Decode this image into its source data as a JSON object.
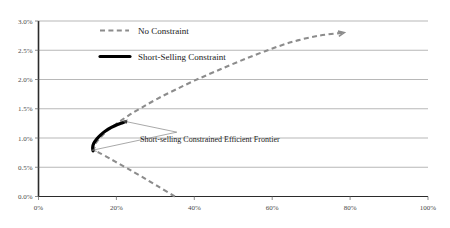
{
  "chart_data": {
    "type": "line",
    "title": "",
    "subtitle": "",
    "xlabel": "",
    "ylabel": "",
    "xlim": [
      0,
      100
    ],
    "ylim": [
      0,
      3.0
    ],
    "x_tick_labels": [
      "0%",
      "20%",
      "40%",
      "60%",
      "80%",
      "100%"
    ],
    "x_ticks": [
      0,
      20,
      40,
      60,
      80,
      100
    ],
    "y_tick_labels": [
      "0.0%",
      "0.5%",
      "1.0%",
      "1.5%",
      "2.0%",
      "2.5%",
      "3.0%"
    ],
    "y_ticks": [
      0.0,
      0.5,
      1.0,
      1.5,
      2.0,
      2.5,
      3.0
    ],
    "grid": "horizontal",
    "legend_position": "top-center",
    "series": [
      {
        "name": "No Constraint",
        "style": "dashed",
        "color": "#8c8c8c",
        "points": [
          [
            35.0,
            0.0
          ],
          [
            30.5,
            0.18
          ],
          [
            26.5,
            0.34
          ],
          [
            22.8,
            0.48
          ],
          [
            19.6,
            0.6
          ],
          [
            17.2,
            0.69
          ],
          [
            15.5,
            0.75
          ],
          [
            14.4,
            0.78
          ],
          [
            14.1,
            0.81
          ],
          [
            14.6,
            0.9
          ],
          [
            15.8,
            1.0
          ],
          [
            17.6,
            1.12
          ],
          [
            20.0,
            1.24
          ],
          [
            23.0,
            1.38
          ],
          [
            26.5,
            1.52
          ],
          [
            30.5,
            1.67
          ],
          [
            35.0,
            1.82
          ],
          [
            40.0,
            1.98
          ],
          [
            45.5,
            2.14
          ],
          [
            51.5,
            2.31
          ],
          [
            58.0,
            2.48
          ],
          [
            65.0,
            2.64
          ],
          [
            72.0,
            2.75
          ],
          [
            78.5,
            2.8
          ]
        ]
      },
      {
        "name": "Short-Selling Constraint",
        "style": "solid",
        "color": "#000000",
        "points": [
          [
            14.0,
            0.78
          ],
          [
            13.9,
            0.84
          ],
          [
            14.2,
            0.91
          ],
          [
            14.9,
            0.98
          ],
          [
            15.9,
            1.05
          ],
          [
            17.2,
            1.12
          ],
          [
            18.7,
            1.18
          ],
          [
            20.3,
            1.23
          ],
          [
            21.6,
            1.26
          ],
          [
            22.4,
            1.28
          ]
        ]
      }
    ],
    "annotations": [
      {
        "text": "Short-selling Constrained Efficient Frontier",
        "anchor_x": 35.5,
        "anchor_y": 1.1,
        "targets": [
          [
            21.8,
            1.29
          ],
          [
            13.8,
            0.79
          ]
        ]
      }
    ],
    "legend": [
      {
        "label": "No Constraint",
        "style": "dashed",
        "color": "#8c8c8c"
      },
      {
        "label": "Short-Selling Constraint",
        "style": "solid",
        "color": "#000000"
      }
    ]
  }
}
